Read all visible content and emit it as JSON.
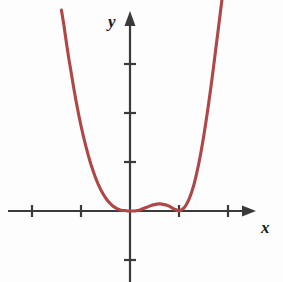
{
  "figure": {
    "background_color": "#fdfdfd",
    "axis_color": "#3a3a3a",
    "curve_color": "#b04646",
    "x_axis_label": "x",
    "y_axis_label": "y"
  },
  "chart_data": {
    "type": "line",
    "title": "",
    "xlabel": "x",
    "ylabel": "y",
    "grid": false,
    "legend": null,
    "xlim": [
      -2.5,
      2.6
    ],
    "ylim": [
      -1.1,
      4.1
    ],
    "xticks": [
      -2,
      -1,
      1,
      2
    ],
    "yticks": [
      -1,
      1,
      2,
      3
    ],
    "xticklabels": [
      "",
      "",
      "",
      ""
    ],
    "yticklabels": [
      "",
      "",
      "",
      ""
    ],
    "annotations": [
      "curve touches the x-axis tangentially at x = 1",
      "local minimum just left of the origin near x = 0.1",
      "local maximum near x = 0.6 slightly above the x-axis",
      "both branches rise steeply off the top of the frame"
    ],
    "series": [
      {
        "name": "quartic curve",
        "x": [
          -1.4,
          -1.35,
          -1.3,
          -1.25,
          -1.2,
          -1.15,
          -1.1,
          -1.05,
          -1.0,
          -0.95,
          -0.9,
          -0.85,
          -0.8,
          -0.75,
          -0.7,
          -0.65,
          -0.6,
          -0.55,
          -0.5,
          -0.45,
          -0.4,
          -0.35,
          -0.3,
          -0.25,
          -0.2,
          -0.15,
          -0.1,
          -0.05,
          0.0,
          0.05,
          0.1,
          0.15,
          0.2,
          0.25,
          0.3,
          0.35,
          0.4,
          0.45,
          0.5,
          0.55,
          0.6,
          0.65,
          0.7,
          0.75,
          0.8,
          0.85,
          0.9,
          0.95,
          1.0,
          1.05,
          1.1,
          1.15,
          1.2,
          1.25,
          1.3,
          1.35,
          1.4,
          1.45,
          1.5,
          1.55,
          1.6,
          1.65,
          1.7,
          1.75,
          1.8,
          1.85,
          1.9,
          1.95,
          2.0
        ],
        "y": [
          4.1,
          3.8,
          3.45,
          3.12,
          2.82,
          2.52,
          2.24,
          1.98,
          1.74,
          1.52,
          1.32,
          1.13,
          0.96,
          0.81,
          0.67,
          0.55,
          0.44,
          0.35,
          0.27,
          0.2,
          0.15,
          0.1,
          0.07,
          0.04,
          0.02,
          0.01,
          0.01,
          0.0,
          0.0,
          0.0,
          0.0,
          0.01,
          0.02,
          0.04,
          0.06,
          0.08,
          0.1,
          0.12,
          0.13,
          0.14,
          0.15,
          0.14,
          0.13,
          0.12,
          0.1,
          0.07,
          0.04,
          0.02,
          0.0,
          0.02,
          0.06,
          0.13,
          0.23,
          0.36,
          0.52,
          0.72,
          0.95,
          1.21,
          1.5,
          1.82,
          2.16,
          2.52,
          2.9,
          3.3,
          3.7,
          4.1,
          4.5,
          4.9,
          5.3
        ]
      }
    ],
    "pixel_geometry": {
      "origin_px": [
        130,
        211
      ],
      "unit_px": 49,
      "x_axis_start_px": 8,
      "x_axis_arrow_tip_px": 256,
      "y_axis_arrow_tip_px": 11,
      "y_axis_bottom_px": 282,
      "tick_half_length_px": 6
    }
  }
}
